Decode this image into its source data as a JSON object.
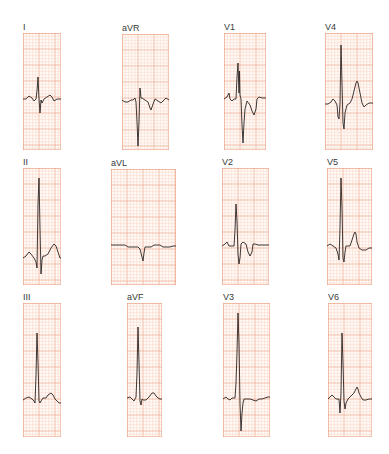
{
  "figure": {
    "grid_color_minor": "#f6c9b5",
    "grid_color_major": "#e99a7c",
    "paper_color": "#fffaf6",
    "trace_color": "#2a2422",
    "caption": ""
  },
  "leads": [
    {
      "label": "I",
      "x": 23,
      "y": 33,
      "w": 38,
      "h": 117,
      "trace": "0,66 3,66 6,63 9,65 11,68 13,66 14,58 15,44 16,66 17,80 18,67 19,70 21,66 24,64 27,62 29,64 31,68 34,66 38,66"
    },
    {
      "label": "aVR",
      "x": 122,
      "y": 34,
      "w": 47,
      "h": 116,
      "trace": "0,66 3,68 6,68 9,66 11,66 13,64 14,68 15,88 16,112 17,88 18,54 19,64 20,64 23,66 26,68 28,74 29,76 31,70 33,65 36,67 39,69 42,66 44,64 47,66"
    },
    {
      "label": "V1",
      "x": 224,
      "y": 33,
      "w": 42,
      "h": 117,
      "trace": "0,66 3,64 5,60 6,66 8,68 10,66 12,66 13,44 14,30 15,60 15.5,38 16,62 17,66 18,92 19,110 20,90 21,76 23,68 26,72 28,78 30,82 32,76 33,66 35,64 38,65 42,65"
    },
    {
      "label": "V4",
      "x": 325,
      "y": 33,
      "w": 48,
      "h": 117,
      "trace": "0,71 3,71 6,69 8,66 10,68 12,72 13,84 14,86 15,70 16,12 17,50 18,90 19,96 20,80 22,72 25,70 27,66 29,58 31,50 32,48 33,50 35,60 37,70 39,74 41,72 44,70 48,70"
    },
    {
      "label": "II",
      "x": 23,
      "y": 168,
      "w": 38,
      "h": 117,
      "trace": "0,90 3,88 6,84 8,86 11,90 13,94 14,100 15,36 16,10 17,60 18,106 19,92 20,88 22,88 25,86 28,80 31,76 33,78 35,84 37,90 38,90"
    },
    {
      "label": "aVL",
      "x": 111,
      "y": 169,
      "w": 65,
      "h": 116,
      "trace": "0,76 5,76 10,76 14,76 17,78 20,78 24,78 27,78 29,80 31,88 32,92 33,84 34,78 37,78 40,78 43,76 46,76 49,76 52,78 55,78 59,78 62,77 65,77"
    },
    {
      "label": "V2",
      "x": 222,
      "y": 168,
      "w": 47,
      "h": 117,
      "trace": "0,78 3,76 5,74 7,78 10,78 12,78 13,62 14,36 15,54 16,86 17,96 18,90 19,76 21,74 24,76 26,84 28,88 30,84 31,76 33,76 36,77 39,77 42,77 45,77 47,77"
    },
    {
      "label": "V5",
      "x": 327,
      "y": 168,
      "w": 45,
      "h": 117,
      "trace": "0,78 3,76 6,78 9,80 11,86 12,92 13,60 14,10 15,40 16,90 17,94 18,84 19,78 21,78 23,78 25,72 27,66 28,64 29,66 30,74 32,80 35,82 39,82 42,80 45,80"
    },
    {
      "label": "III",
      "x": 23,
      "y": 303,
      "w": 38,
      "h": 134,
      "trace": "0,97 3,95 6,94 9,96 11,98 12,100 13,72 14,30 15,60 16,98 17,100 18,98 20,95 23,95 25,92 28,90 30,92 32,96 34,98 36,100 38,100"
    },
    {
      "label": "aVF",
      "x": 127,
      "y": 303,
      "w": 35,
      "h": 134,
      "trace": "0,95 3,94 5,96 7,98 9,94 10,70 11,24 12,60 13,98 14,102 15,96 16,97 19,97 22,94 25,90 27,90 29,93 31,95 33,96 35,96"
    },
    {
      "label": "V3",
      "x": 223,
      "y": 303,
      "w": 47,
      "h": 134,
      "trace": "0,96 3,94 5,96 7,97 9,95 12,95 13,80 14,50 15,10 16,40 17,100 18,128 19,110 20,100 21,96 24,96 27,96 30,97 33,98 36,96 39,96 42,95 45,94 47,94"
    },
    {
      "label": "V6",
      "x": 328,
      "y": 303,
      "w": 44,
      "h": 134,
      "trace": "0,96 2,94 4,92 6,94 8,96 11,96 12,110 13,90 14,30 15,60 16,98 17,106 18,100 20,96 22,94 24,92 26,90 28,86 29,84 30,86 31,90 33,94 35,97 38,97 41,96 44,96"
    }
  ]
}
